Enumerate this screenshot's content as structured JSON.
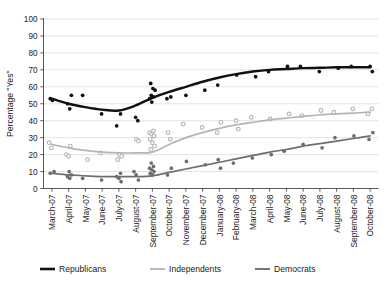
{
  "chart_data": {
    "type": "scatter",
    "title": "",
    "xlabel": "",
    "ylabel": "Percentage \"Yes\"",
    "ylim": [
      0,
      100
    ],
    "ytick_step": 10,
    "grid": true,
    "legend_position": "bottom",
    "yticks": [
      "0",
      "10",
      "20",
      "30",
      "40",
      "50",
      "60",
      "70",
      "80",
      "90",
      "100"
    ],
    "categories": [
      "March-07",
      "April-07",
      "May-07",
      "June-07",
      "July-07",
      "August-07",
      "September-07",
      "October-07",
      "November-07",
      "December-07",
      "January-08",
      "February-08",
      "March-08",
      "April-08",
      "May-08",
      "June-08",
      "July-08",
      "August-08",
      "September-08",
      "October-08"
    ],
    "series": [
      {
        "name": "Republicans",
        "color": "#111111",
        "marker": "filled-circle",
        "trend": [
          53,
          50,
          48,
          46.5,
          46,
          49,
          53.5,
          57,
          60,
          63,
          65.5,
          67.5,
          69,
          70,
          70.5,
          71,
          71.2,
          71.5,
          71.5,
          71.5
        ],
        "points": [
          [
            0,
            53
          ],
          [
            0,
            52
          ],
          [
            1,
            55
          ],
          [
            1,
            50
          ],
          [
            1,
            47
          ],
          [
            2,
            55
          ],
          [
            3,
            44
          ],
          [
            4,
            44
          ],
          [
            4,
            37
          ],
          [
            5,
            42
          ],
          [
            5,
            40
          ],
          [
            6,
            62
          ],
          [
            6,
            59
          ],
          [
            6,
            58
          ],
          [
            6,
            55
          ],
          [
            6,
            54
          ],
          [
            6,
            53
          ],
          [
            6,
            51
          ],
          [
            7,
            54
          ],
          [
            7,
            53
          ],
          [
            8,
            55
          ],
          [
            9,
            58
          ],
          [
            10,
            61
          ],
          [
            11,
            67
          ],
          [
            12,
            66
          ],
          [
            13,
            69
          ],
          [
            14,
            72
          ],
          [
            15,
            72
          ],
          [
            16,
            69
          ],
          [
            17,
            71
          ],
          [
            18,
            72
          ],
          [
            19,
            72
          ],
          [
            19,
            69
          ]
        ]
      },
      {
        "name": "Independents",
        "color": "#b5b5b5",
        "marker": "open-circle",
        "trend": [
          26,
          24,
          22.5,
          21.5,
          21,
          21,
          21.5,
          26,
          30,
          33,
          35.5,
          37.5,
          39,
          40.5,
          41.5,
          42.5,
          43.5,
          44,
          44.5,
          45
        ],
        "points": [
          [
            0,
            27
          ],
          [
            0,
            24
          ],
          [
            1,
            25
          ],
          [
            1,
            20
          ],
          [
            1,
            19
          ],
          [
            2,
            17
          ],
          [
            3,
            21
          ],
          [
            4,
            20
          ],
          [
            4,
            19
          ],
          [
            4,
            17
          ],
          [
            6,
            34
          ],
          [
            6,
            33
          ],
          [
            6,
            32
          ],
          [
            6,
            31
          ],
          [
            6,
            29
          ],
          [
            6,
            27
          ],
          [
            6,
            25
          ],
          [
            6,
            23
          ],
          [
            5,
            29
          ],
          [
            5,
            28
          ],
          [
            7,
            33
          ],
          [
            7,
            29
          ],
          [
            8,
            38
          ],
          [
            9,
            36
          ],
          [
            10,
            39
          ],
          [
            10,
            33
          ],
          [
            11,
            40
          ],
          [
            11,
            35
          ],
          [
            12,
            42
          ],
          [
            13,
            41
          ],
          [
            14,
            44
          ],
          [
            15,
            43
          ],
          [
            16,
            46
          ],
          [
            17,
            45
          ],
          [
            18,
            47
          ],
          [
            19,
            47
          ],
          [
            19,
            44
          ]
        ]
      },
      {
        "name": "Democrats",
        "color": "#6e6e6e",
        "marker": "filled-circle",
        "trend": [
          9,
          8,
          7.5,
          7,
          7,
          7,
          7.5,
          9.5,
          11.5,
          13.5,
          15.5,
          17.5,
          19.5,
          21.5,
          23,
          25,
          26.5,
          28,
          29.5,
          31
        ],
        "points": [
          [
            0,
            10
          ],
          [
            0,
            9
          ],
          [
            1,
            10
          ],
          [
            1,
            8
          ],
          [
            1,
            7
          ],
          [
            1,
            6
          ],
          [
            2,
            6
          ],
          [
            3,
            5
          ],
          [
            4,
            9
          ],
          [
            4,
            7
          ],
          [
            4,
            6
          ],
          [
            4,
            4
          ],
          [
            5,
            10
          ],
          [
            5,
            8
          ],
          [
            5,
            5
          ],
          [
            6,
            15
          ],
          [
            6,
            13
          ],
          [
            6,
            12
          ],
          [
            6,
            11
          ],
          [
            6,
            10
          ],
          [
            6,
            9
          ],
          [
            6,
            8
          ],
          [
            7,
            12
          ],
          [
            7,
            8
          ],
          [
            8,
            16
          ],
          [
            9,
            14
          ],
          [
            10,
            17
          ],
          [
            10,
            12
          ],
          [
            11,
            15
          ],
          [
            12,
            18
          ],
          [
            13,
            20
          ],
          [
            14,
            22
          ],
          [
            15,
            26
          ],
          [
            16,
            24
          ],
          [
            17,
            30
          ],
          [
            18,
            31
          ],
          [
            19,
            33
          ],
          [
            19,
            29
          ]
        ]
      }
    ],
    "legend": [
      {
        "label": "Republicans",
        "color": "#111111",
        "width": 2.6
      },
      {
        "label": "Independents",
        "color": "#b5b5b5",
        "width": 1.9
      },
      {
        "label": "Democrats",
        "color": "#6e6e6e",
        "width": 1.9
      }
    ]
  }
}
